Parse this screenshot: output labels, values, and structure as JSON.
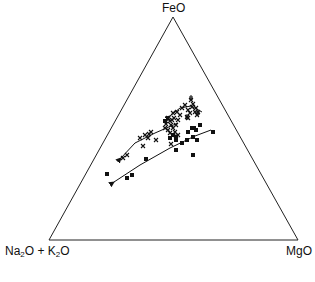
{
  "chart_data": {
    "type": "scatter",
    "subtype": "ternary (AFM diagram)",
    "title": "",
    "vertices": {
      "top": "FeO",
      "bottom_left": "Na2O + K2O",
      "bottom_right": "MgO"
    },
    "series": [
      {
        "name": "crosses (upper trend)",
        "marker": "x",
        "points_px": [
          [
            123,
            158
          ],
          [
            127,
            155
          ],
          [
            140,
            138
          ],
          [
            145,
            135
          ],
          [
            149,
            134
          ],
          [
            151,
            132
          ],
          [
            148,
            138
          ],
          [
            143,
            146
          ],
          [
            156,
            140
          ],
          [
            165,
            128
          ],
          [
            166,
            124
          ],
          [
            168,
            130
          ],
          [
            170,
            133
          ],
          [
            171,
            125
          ],
          [
            172,
            120
          ],
          [
            174,
            118
          ],
          [
            173,
            128
          ],
          [
            175,
            132
          ],
          [
            176,
            125
          ],
          [
            178,
            120
          ],
          [
            180,
            115
          ],
          [
            182,
            108
          ],
          [
            185,
            105
          ],
          [
            188,
            110
          ],
          [
            190,
            113
          ],
          [
            192,
            107
          ],
          [
            195,
            112
          ],
          [
            196,
            108
          ],
          [
            198,
            112
          ],
          [
            173,
            113
          ],
          [
            177,
            112
          ],
          [
            170,
            121
          ],
          [
            168,
            118
          ],
          [
            187,
            117
          ],
          [
            191,
            100
          ],
          [
            188,
            118
          ],
          [
            193,
            104
          ],
          [
            197,
            115
          ],
          [
            171,
            144
          ],
          [
            176,
            136
          ],
          [
            178,
            135
          ]
        ],
        "points_plus_px": [
          [
            191,
            98
          ],
          [
            187,
            117
          ],
          [
            198,
            113
          ]
        ]
      },
      {
        "name": "squares (lower trend)",
        "marker": "square",
        "points_px": [
          [
            107,
            174
          ],
          [
            127,
            178
          ],
          [
            132,
            175
          ],
          [
            146,
            159
          ],
          [
            165,
            121
          ],
          [
            176,
            150
          ],
          [
            176,
            140
          ],
          [
            176,
            137
          ],
          [
            188,
            132
          ],
          [
            192,
            128
          ],
          [
            194,
            128
          ],
          [
            196,
            130
          ],
          [
            193,
            137
          ],
          [
            197,
            140
          ],
          [
            200,
            125
          ],
          [
            193,
            155
          ],
          [
            213,
            132
          ],
          [
            187,
            140
          ],
          [
            182,
            143
          ],
          [
            173,
            135
          ],
          [
            170,
            138
          ]
        ]
      }
    ],
    "trend_lines_px": [
      {
        "name": "upper trend",
        "points": [
          [
            121,
            158
          ],
          [
            135,
            143
          ],
          [
            155,
            133
          ],
          [
            178,
            123
          ]
        ],
        "arrow_at": "start"
      },
      {
        "name": "upper-right branch",
        "points": [
          [
            170,
            116
          ],
          [
            180,
            108
          ],
          [
            191,
            106
          ],
          [
            202,
            112
          ]
        ],
        "arrow_at": "start"
      },
      {
        "name": "lower trend",
        "points": [
          [
            114,
            182
          ],
          [
            140,
            165
          ],
          [
            170,
            148
          ],
          [
            195,
            136
          ],
          [
            211,
            130
          ]
        ],
        "arrow_at": "start"
      }
    ]
  },
  "labels": {
    "top": "FeO",
    "bottom_left_a": "Na",
    "bottom_left_sub_a": "2",
    "bottom_left_b": "O + K",
    "bottom_left_sub_b": "2",
    "bottom_left_c": "O",
    "bottom_right": "MgO"
  }
}
